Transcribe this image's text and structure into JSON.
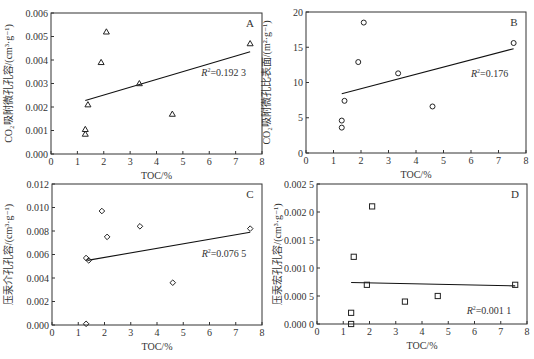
{
  "chart_data": [
    {
      "id": "A",
      "type": "scatter",
      "panel_label": "A",
      "title": "",
      "xlabel": "TOC/%",
      "ylabel": "CO₂吸附微孔孔容/(cm³·g⁻¹)",
      "xlim": [
        0,
        8
      ],
      "ylim": [
        0,
        0.006
      ],
      "x_ticks": [
        0,
        1,
        2,
        3,
        4,
        5,
        6,
        7,
        8
      ],
      "y_ticks": [
        0,
        0.001,
        0.002,
        0.003,
        0.004,
        0.005,
        0.006
      ],
      "y_tick_labels": [
        "0.000",
        "0.001",
        "0.002",
        "0.003",
        "0.004",
        "0.005",
        "0.006"
      ],
      "marker": "triangle",
      "grid": false,
      "points": [
        [
          1.3,
          0.00085
        ],
        [
          1.3,
          0.00105
        ],
        [
          1.4,
          0.0021
        ],
        [
          1.9,
          0.0039
        ],
        [
          2.1,
          0.0052
        ],
        [
          3.35,
          0.003
        ],
        [
          4.6,
          0.0017
        ],
        [
          7.55,
          0.0047
        ]
      ],
      "trendline": [
        [
          1.3,
          0.00228
        ],
        [
          7.55,
          0.00435
        ]
      ],
      "r2_label": "=0.192 3",
      "r2_pos": [
        5.7,
        0.0033
      ],
      "box": {
        "left": 51,
        "top": 13,
        "right": 262,
        "bottom": 154
      }
    },
    {
      "id": "B",
      "type": "scatter",
      "panel_label": "B",
      "title": "",
      "xlabel": "TOC/%",
      "ylabel": "CO₂吸附微孔比表面/(m²·g⁻¹)",
      "xlim": [
        0,
        8
      ],
      "ylim": [
        0,
        20
      ],
      "x_ticks": [
        0,
        1,
        2,
        3,
        4,
        5,
        6,
        7,
        8
      ],
      "y_ticks": [
        0,
        5,
        10,
        15,
        20
      ],
      "y_tick_labels": [
        "0",
        "5",
        "10",
        "15",
        "20"
      ],
      "marker": "circle",
      "grid": false,
      "points": [
        [
          1.3,
          3.6
        ],
        [
          1.3,
          4.6
        ],
        [
          1.4,
          7.4
        ],
        [
          1.9,
          12.9
        ],
        [
          2.1,
          18.5
        ],
        [
          3.35,
          11.3
        ],
        [
          4.6,
          6.6
        ],
        [
          7.55,
          15.6
        ]
      ],
      "trendline": [
        [
          1.3,
          8.4
        ],
        [
          7.55,
          14.8
        ]
      ],
      "r2_label": "=0.176",
      "r2_pos": [
        6.0,
        10.8
      ],
      "box": {
        "left": 306,
        "top": 12,
        "right": 526,
        "bottom": 153
      }
    },
    {
      "id": "C",
      "type": "scatter",
      "panel_label": "C",
      "title": "",
      "xlabel": "TOC/%",
      "ylabel": "压汞介孔孔容/(cm³·g⁻¹)",
      "xlim": [
        0,
        8
      ],
      "ylim": [
        0,
        0.012
      ],
      "x_ticks": [
        0,
        1,
        2,
        3,
        4,
        5,
        6,
        7,
        8
      ],
      "y_ticks": [
        0,
        0.002,
        0.004,
        0.006,
        0.008,
        0.01,
        0.012
      ],
      "y_tick_labels": [
        "0.000",
        "0.002",
        "0.004",
        "0.006",
        "0.008",
        "0.010",
        "0.012"
      ],
      "marker": "diamond",
      "grid": false,
      "points": [
        [
          1.3,
          0.0001
        ],
        [
          1.3,
          0.0057
        ],
        [
          1.4,
          0.0055
        ],
        [
          1.9,
          0.0097
        ],
        [
          2.1,
          0.0075
        ],
        [
          3.35,
          0.0084
        ],
        [
          4.6,
          0.0036
        ],
        [
          7.55,
          0.0082
        ]
      ],
      "trendline": [
        [
          1.35,
          0.0055
        ],
        [
          7.55,
          0.0079
        ]
      ],
      "r2_label": "=0.076 5",
      "r2_pos": [
        5.7,
        0.0058
      ],
      "box": {
        "left": 52,
        "top": 184,
        "right": 262,
        "bottom": 325
      }
    },
    {
      "id": "D",
      "type": "scatter",
      "panel_label": "D",
      "title": "",
      "xlabel": "TOC/%",
      "ylabel": "压汞宏孔孔容/(cm³·g⁻¹)",
      "xlim": [
        0,
        8
      ],
      "ylim": [
        0,
        0.0025
      ],
      "x_ticks": [
        0,
        1,
        2,
        3,
        4,
        5,
        6,
        7,
        8
      ],
      "y_ticks": [
        0,
        0.0005,
        0.001,
        0.0015,
        0.002,
        0.0025
      ],
      "y_tick_labels": [
        "0.000 0",
        "0.000 5",
        "0.001 0",
        "0.001 5",
        "0.002 0",
        "0.002 5"
      ],
      "marker": "square",
      "grid": false,
      "points": [
        [
          1.3,
          0.0
        ],
        [
          1.3,
          0.0002
        ],
        [
          1.4,
          0.0012
        ],
        [
          1.9,
          0.0007
        ],
        [
          2.1,
          0.0021
        ],
        [
          3.35,
          0.0004
        ],
        [
          4.6,
          0.0005
        ],
        [
          7.55,
          0.0007
        ]
      ],
      "trendline": [
        [
          1.3,
          0.00074
        ],
        [
          7.55,
          0.00068
        ]
      ],
      "r2_label": "=0.001 1",
      "r2_pos": [
        5.7,
        0.00018
      ],
      "box": {
        "left": 317,
        "top": 184,
        "right": 527,
        "bottom": 324
      }
    }
  ],
  "colors": {
    "axis": "#333333",
    "marker": "#222222",
    "trendline": "#111111",
    "text": "#333333",
    "background": "#ffffff"
  }
}
